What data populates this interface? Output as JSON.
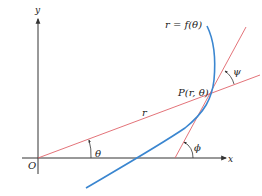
{
  "figure": {
    "axes": {
      "x_label": "x",
      "y_label": "y",
      "origin_label": "O",
      "color": "#333333"
    },
    "curve": {
      "label": "r = f(θ)",
      "color": "#3a86d0"
    },
    "point": {
      "label": "P(r, θ)"
    },
    "radius_line": {
      "label": "r",
      "color": "#e0636a"
    },
    "tangent_line": {
      "color": "#e0636a"
    },
    "angles": {
      "theta": "θ",
      "phi": "ϕ",
      "psi": "ψ"
    }
  }
}
